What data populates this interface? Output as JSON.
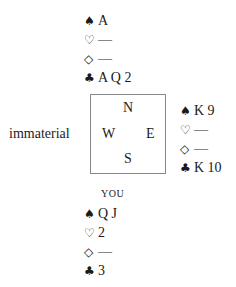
{
  "north": {
    "spades": "A",
    "hearts": "—",
    "diamonds": "—",
    "clubs": "A Q 2"
  },
  "east": {
    "spades": "K 9",
    "hearts": "—",
    "diamonds": "—",
    "clubs": "K 10"
  },
  "south": {
    "label": "YOU",
    "spades": "Q J",
    "hearts": "2",
    "diamonds": "—",
    "clubs": "3"
  },
  "west": {
    "text": "immaterial"
  },
  "compass": {
    "n": "N",
    "w": "W",
    "e": "E",
    "s": "S"
  },
  "suits": {
    "spade": "♠",
    "heart": "♡",
    "diamond": "◇",
    "club": "♣"
  }
}
